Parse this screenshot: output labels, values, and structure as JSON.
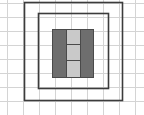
{
  "canvas": {
    "width": 144,
    "height": 115,
    "background_color": "#ffffff",
    "title": "Nested rectangular frame diagram"
  },
  "grid": {
    "visible": true,
    "line_color": "#d4d4d4",
    "line_width": 1,
    "x_spacing": 16,
    "y_spacing": 14,
    "x_origin": 7,
    "y_origin": 3,
    "vertical_line_positions": [
      7,
      23,
      39,
      55,
      71,
      87,
      103,
      119,
      135
    ],
    "horizontal_line_positions": [
      3,
      17,
      31,
      45,
      59,
      73,
      87,
      101
    ]
  },
  "shapes": {
    "outer_frame": {
      "label": "outer-frame",
      "x": 24,
      "y": 2,
      "width": 98,
      "height": 98,
      "fill": "none",
      "stroke_color": "#3c3c3c",
      "stroke_width": 1.6
    },
    "inner_frame": {
      "label": "inner-frame",
      "x": 38,
      "y": 13,
      "width": 70,
      "height": 75,
      "fill": "none",
      "stroke_color": "#3c3c3c",
      "stroke_width": 1.6
    },
    "center_block": {
      "label": "center-block",
      "x": 52,
      "y": 29,
      "width": 41,
      "height": 48,
      "fill": "#6e6e6e",
      "stroke_color": "#4a4a4a",
      "stroke_width": 1
    },
    "light_strip": {
      "label": "light-strip",
      "x": 66,
      "y": 29,
      "width": 14,
      "height": 48,
      "fill": "#c9c9c9",
      "stroke_color": "#4a4a4a",
      "stroke_width": 1,
      "cell_count": 3,
      "divider_color": "#4a4a4a",
      "divider_width": 1,
      "divider_y_positions": [
        44,
        60
      ],
      "cells": [
        {
          "label": "strip-cell-1",
          "y": 29,
          "height": 15,
          "fill": "#c9c9c9"
        },
        {
          "label": "strip-cell-2",
          "y": 44,
          "height": 16,
          "fill": "#c9c9c9"
        },
        {
          "label": "strip-cell-3",
          "y": 60,
          "height": 17,
          "fill": "#c9c9c9"
        }
      ]
    }
  }
}
